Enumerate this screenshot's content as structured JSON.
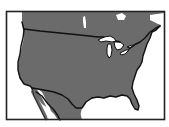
{
  "map": {
    "subject": "Contiguous United States",
    "style": "grayscale silhouette with black border outlines",
    "colors": {
      "background": "#ffffff",
      "land": "#6b6b6b",
      "water": "#ffffff",
      "border": "#111111",
      "frame": "#222222"
    },
    "regions": [
      "United States",
      "Canada",
      "Mexico"
    ],
    "features": [
      "Great Lakes",
      "Gulf of Mexico",
      "Baja California",
      "Florida peninsula"
    ]
  }
}
